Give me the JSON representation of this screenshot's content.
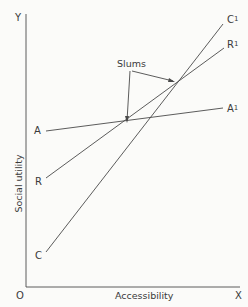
{
  "diagram": {
    "axes": {
      "y_end_label": "Y",
      "x_end_label": "X",
      "origin_label": "O",
      "y_axis_title": "Social utility",
      "x_axis_title": "Accessibility"
    },
    "lines": [
      {
        "start_label": "A",
        "end_label": "A",
        "end_sup": "1"
      },
      {
        "start_label": "R",
        "end_label": "R",
        "end_sup": "1"
      },
      {
        "start_label": "C",
        "end_label": "C",
        "end_sup": "1"
      }
    ],
    "annotation": "Slums",
    "colors": {
      "ink": "#3a3a3a",
      "background": "#fbfbf9"
    }
  }
}
